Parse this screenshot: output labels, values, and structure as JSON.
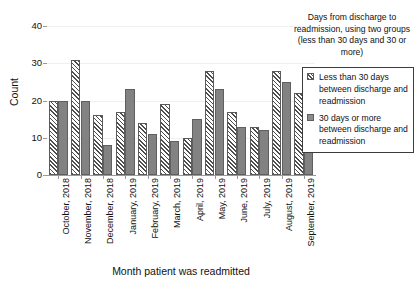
{
  "chart_data": {
    "type": "bar",
    "title": "",
    "xlabel": "Month patient was readmitted",
    "ylabel": "Count",
    "ylim": [
      0,
      40
    ],
    "yticks": [
      0,
      10,
      20,
      30,
      40
    ],
    "grid": true,
    "legend_position": "right",
    "legend_title": "Days from discharge to readmission, using two groups (less than 30 days and 30 or more)",
    "categories": [
      "October, 2018",
      "November, 2018",
      "December, 2018",
      "January, 2019",
      "February, 2019",
      "March, 2019",
      "April, 2019",
      "May, 2019",
      "June, 2019",
      "July, 2019",
      "August, 2019",
      "September, 2019"
    ],
    "series": [
      {
        "name": "Less than 30 days between discharge and readmission",
        "fill": "diagonal-hatch",
        "color": "#4d4d4d",
        "values": [
          20,
          31,
          16,
          17,
          14,
          19,
          10,
          28,
          17,
          13,
          28,
          22
        ]
      },
      {
        "name": "30 days or more between discharge and readmission",
        "fill": "solid",
        "color": "#828282",
        "values": [
          20,
          20,
          8,
          23,
          11,
          9,
          15,
          23,
          13,
          12,
          25,
          14
        ]
      }
    ]
  }
}
